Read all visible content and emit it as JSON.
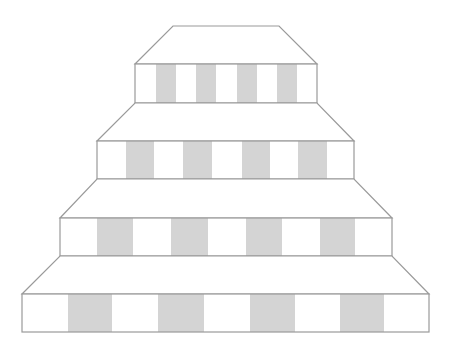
{
  "figure": {
    "colors": {
      "background": "#ffffff",
      "outline": "#9a9a9a",
      "stripe": "#d4d4d4",
      "face": "#ffffff"
    },
    "tiers": [
      {
        "name": "tier-1",
        "top": {
          "top_left": [
            173,
            26
          ],
          "top_right": [
            279,
            26
          ],
          "bottom_left": [
            135,
            64
          ],
          "bottom_right": [
            317,
            64
          ]
        },
        "front": {
          "x": 135,
          "y": 64,
          "width": 182,
          "height": 39
        },
        "stripes": [
          [
            156,
            176
          ],
          [
            196,
            216
          ],
          [
            237,
            257
          ],
          [
            277,
            297
          ]
        ]
      },
      {
        "name": "tier-2",
        "top": {
          "top_left": [
            135,
            103
          ],
          "top_right": [
            317,
            103
          ],
          "bottom_left": [
            97,
            141
          ],
          "bottom_right": [
            354,
            141
          ]
        },
        "front": {
          "x": 97,
          "y": 141,
          "width": 257,
          "height": 38
        },
        "stripes": [
          [
            126,
            154
          ],
          [
            183,
            212
          ],
          [
            242,
            270
          ],
          [
            298,
            327
          ]
        ]
      },
      {
        "name": "tier-3",
        "top": {
          "top_left": [
            97,
            179
          ],
          "top_right": [
            354,
            179
          ],
          "bottom_left": [
            60,
            218
          ],
          "bottom_right": [
            392,
            218
          ]
        },
        "front": {
          "x": 60,
          "y": 218,
          "width": 332,
          "height": 38
        },
        "stripes": [
          [
            97,
            133
          ],
          [
            171,
            208
          ],
          [
            246,
            282
          ],
          [
            320,
            355
          ]
        ]
      },
      {
        "name": "tier-4",
        "top": {
          "top_left": [
            60,
            256
          ],
          "top_right": [
            392,
            256
          ],
          "bottom_left": [
            22,
            294
          ],
          "bottom_right": [
            429,
            294
          ]
        },
        "front": {
          "x": 22,
          "y": 294,
          "width": 407,
          "height": 38
        },
        "stripes": [
          [
            68,
            112
          ],
          [
            158,
            204
          ],
          [
            250,
            295
          ],
          [
            340,
            384
          ]
        ]
      }
    ]
  }
}
